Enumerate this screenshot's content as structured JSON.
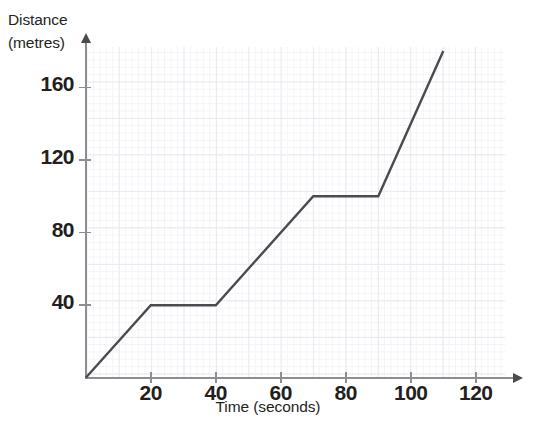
{
  "chart_data": {
    "type": "line",
    "title": "",
    "xlabel": "Time (seconds)",
    "ylabel": "Distance (metres)",
    "ylabel_line1": "Distance",
    "ylabel_line2": "(metres)",
    "xlim": [
      0,
      130
    ],
    "ylim": [
      0,
      185
    ],
    "xticks": [
      20,
      40,
      60,
      80,
      100,
      120
    ],
    "xtick_labels": [
      "20",
      "40",
      "60",
      "80",
      "100",
      "120"
    ],
    "yticks": [
      40,
      80,
      120,
      160
    ],
    "ytick_labels": [
      "40",
      "80",
      "120",
      "160"
    ],
    "grid": true,
    "grid_minor": true,
    "legend": "none",
    "series": [
      {
        "name": "journey",
        "x": [
          0,
          20,
          40,
          70,
          90,
          110
        ],
        "y": [
          0,
          40,
          40,
          100,
          100,
          180
        ],
        "points": [
          {
            "t": 0,
            "d": 0
          },
          {
            "t": 20,
            "d": 40
          },
          {
            "t": 40,
            "d": 40
          },
          {
            "t": 70,
            "d": 100
          },
          {
            "t": 90,
            "d": 100
          },
          {
            "t": 110,
            "d": 180
          }
        ],
        "color": "#4a4a50"
      }
    ]
  },
  "style": {
    "line_color": "#4a4a50",
    "axis_color": "#8d8d93",
    "grid_major_color": "#e9e9ef",
    "grid_minor_color": "#f4f4f8",
    "text_color": "#231f20",
    "background": "#ffffff"
  }
}
